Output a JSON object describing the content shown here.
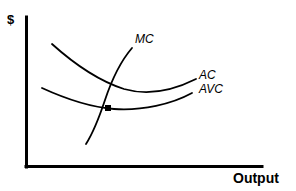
{
  "figure": {
    "type": "economics-cost-curve-diagram",
    "background_color": "#ffffff",
    "stroke_color": "#000000"
  },
  "axes": {
    "y_axis_label": "$",
    "x_axis_label": "Output",
    "y_axis": {
      "x": 26,
      "y_top": 17,
      "y_bottom": 167,
      "width": 3
    },
    "x_axis": {
      "y": 167,
      "x_left": 26,
      "x_right": 262,
      "height": 3
    }
  },
  "curve_labels": {
    "mc": "MC",
    "ac": "AC",
    "avc": "AVC"
  },
  "chart_data": {
    "type": "line",
    "title": "",
    "xlabel": "Output",
    "ylabel": "$",
    "grid": false,
    "legend": "inline-curve-labels",
    "axis_origin": [
      26,
      167
    ],
    "note": "Standard short-run cost curve diagram. MC rises steeply and cuts AVC at its minimum; AC and AVC are U-shaped with AC above AVC.",
    "series": [
      {
        "name": "MC",
        "label": "MC",
        "label_position": [
          135,
          33
        ],
        "path": "M 86 144 C 93 133 99 118 105 100 C 111 82 120 62 132 48",
        "description": "Marginal cost curve, steeply upward sloping, cuts AVC at its minimum point",
        "points": [
          [
            86,
            144
          ],
          [
            95,
            128
          ],
          [
            103,
            110
          ],
          [
            112,
            88
          ],
          [
            122,
            68
          ],
          [
            132,
            48
          ]
        ]
      },
      {
        "name": "AC",
        "label": "AC",
        "label_position": [
          199,
          69
        ],
        "path": "M 52 44 C 72 62 96 80 124 89 C 152 97 180 87 196 79",
        "description": "Average total cost curve, U-shaped, lies above AVC",
        "points": [
          [
            52,
            44
          ],
          [
            72,
            62
          ],
          [
            96,
            79
          ],
          [
            124,
            89
          ],
          [
            152,
            92
          ],
          [
            176,
            86
          ],
          [
            196,
            79
          ]
        ]
      },
      {
        "name": "AVC",
        "label": "AVC",
        "label_position": [
          199,
          83
        ],
        "path": "M 42 88 C 66 99 88 107 114 109 C 142 111 172 104 192 93",
        "description": "Average variable cost curve, U-shaped, minimum at intersection with MC",
        "points": [
          [
            42,
            88
          ],
          [
            66,
            99
          ],
          [
            88,
            106
          ],
          [
            114,
            109
          ],
          [
            142,
            109
          ],
          [
            170,
            103
          ],
          [
            192,
            93
          ]
        ]
      }
    ],
    "annotations": [
      {
        "name": "mc-avc-intersection",
        "type": "point",
        "shape": "filled-square-dot",
        "x": 108,
        "y": 108,
        "size": 6,
        "description": "Minimum point of AVC where MC intersects AVC"
      }
    ]
  }
}
